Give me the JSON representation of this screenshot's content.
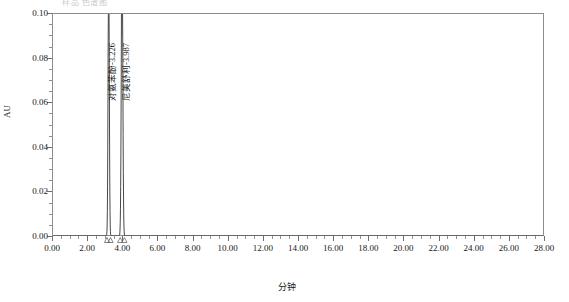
{
  "header": {
    "note": "样品 色谱图"
  },
  "chart_data": {
    "type": "line",
    "title": "",
    "subtitle": "",
    "xlabel": "分钟",
    "ylabel": "AU",
    "xlim": [
      0.0,
      28.0
    ],
    "ylim": [
      0.0,
      0.1
    ],
    "grid": false,
    "legend": "none",
    "x_ticks": [
      "0.00",
      "2.00",
      "4.00",
      "6.00",
      "8.00",
      "10.00",
      "12.00",
      "14.00",
      "16.00",
      "18.00",
      "20.00",
      "22.00",
      "24.00",
      "26.00",
      "28.00"
    ],
    "x_tick_values": [
      0,
      2,
      4,
      6,
      8,
      10,
      12,
      14,
      16,
      18,
      20,
      22,
      24,
      26,
      28
    ],
    "x_minor_step": 0.5,
    "y_ticks": [
      "0.00",
      "0.02",
      "0.04",
      "0.06",
      "0.08",
      "0.10"
    ],
    "y_tick_values": [
      0.0,
      0.02,
      0.04,
      0.06,
      0.08,
      0.1
    ],
    "y_minor_step": 0.005,
    "baseline": 0.0,
    "series": [
      {
        "name": "detector-signal",
        "color": "#333333",
        "peaks": [
          {
            "label": "对氨苯酚-3.226",
            "compound": "对氨苯酚",
            "retention_time": 3.226,
            "height": 0.125,
            "clipped": true,
            "width": 0.1,
            "marker_start": 3.13,
            "marker_end": 3.33
          },
          {
            "label": "尼美舒利-3.987",
            "compound": "尼美舒利",
            "retention_time": 3.987,
            "height": 0.135,
            "clipped": true,
            "width": 0.12,
            "marker_start": 3.88,
            "marker_end": 4.12
          }
        ]
      }
    ],
    "annotations": [
      {
        "text": "对氨苯酚-3.226",
        "x": 3.226,
        "orientation": "vertical"
      },
      {
        "text": "尼美舒利-3.987",
        "x": 3.987,
        "orientation": "vertical"
      }
    ]
  }
}
